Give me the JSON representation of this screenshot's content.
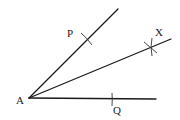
{
  "diagram": {
    "vertex": {
      "label": "A",
      "x": 29,
      "y": 98
    },
    "rays": [
      {
        "name": "ray-ap",
        "from": [
          29,
          98
        ],
        "to": [
          118,
          9
        ]
      },
      {
        "name": "ray-ax-bisector",
        "from": [
          29,
          98
        ],
        "to": [
          171,
          39
        ]
      },
      {
        "name": "ray-aq",
        "from": [
          29,
          98
        ],
        "to": [
          156,
          99
        ]
      }
    ],
    "points": [
      {
        "label": "P",
        "x": 88,
        "y": 40
      },
      {
        "label": "X",
        "x": 151,
        "y": 48
      },
      {
        "label": "Q",
        "x": 112,
        "y": 99
      }
    ],
    "labels": {
      "A": "A",
      "P": "P",
      "X": "X",
      "Q": "Q"
    },
    "colors": {
      "line": "#1a1a1a",
      "background": "#ffffff"
    }
  }
}
